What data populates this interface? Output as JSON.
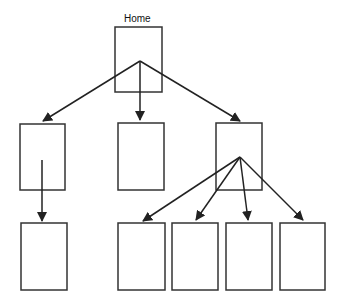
{
  "diagram": {
    "title": "Home",
    "stroke_color": "#333333",
    "nodes": [
      {
        "id": "home",
        "label": "Home",
        "x": 115,
        "y": 27,
        "w": 47,
        "h": 65
      },
      {
        "id": "l1a",
        "x": 20,
        "y": 124,
        "w": 45,
        "h": 66
      },
      {
        "id": "l1b",
        "x": 118,
        "y": 123,
        "w": 46,
        "h": 67
      },
      {
        "id": "l1c",
        "x": 216,
        "y": 123,
        "w": 46,
        "h": 67
      },
      {
        "id": "l2a",
        "x": 21,
        "y": 223,
        "w": 46,
        "h": 67
      },
      {
        "id": "l2b",
        "x": 118,
        "y": 223,
        "w": 47,
        "h": 67
      },
      {
        "id": "l2c",
        "x": 172,
        "y": 223,
        "w": 46,
        "h": 67
      },
      {
        "id": "l2d",
        "x": 226,
        "y": 223,
        "w": 46,
        "h": 67
      },
      {
        "id": "l2e",
        "x": 280,
        "y": 223,
        "w": 45,
        "h": 67
      }
    ],
    "edges": [
      {
        "from": "home",
        "to": "l1a"
      },
      {
        "from": "home",
        "to": "l1b"
      },
      {
        "from": "home",
        "to": "l1c"
      },
      {
        "from": "l1a",
        "to": "l2a"
      },
      {
        "from": "l1c",
        "to": "l2b"
      },
      {
        "from": "l1c",
        "to": "l2c"
      },
      {
        "from": "l1c",
        "to": "l2d"
      },
      {
        "from": "l1c",
        "to": "l2e"
      }
    ]
  }
}
